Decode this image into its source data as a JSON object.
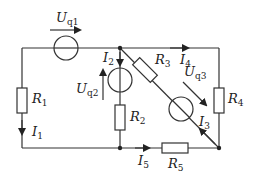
{
  "diagram": {
    "type": "electrical-circuit",
    "sources": [
      {
        "id": "Uq1",
        "label": "U",
        "sub": "q1"
      },
      {
        "id": "Uq2",
        "label": "U",
        "sub": "q2"
      },
      {
        "id": "Uq3",
        "label": "U",
        "sub": "q3"
      }
    ],
    "resistors": [
      {
        "id": "R1",
        "label": "R",
        "sub": "1"
      },
      {
        "id": "R2",
        "label": "R",
        "sub": "2"
      },
      {
        "id": "R3",
        "label": "R",
        "sub": "3"
      },
      {
        "id": "R4",
        "label": "R",
        "sub": "4"
      },
      {
        "id": "R5",
        "label": "R",
        "sub": "5"
      }
    ],
    "currents": [
      {
        "id": "I1",
        "label": "I",
        "sub": "1"
      },
      {
        "id": "I2",
        "label": "I",
        "sub": "2"
      },
      {
        "id": "I3",
        "label": "I",
        "sub": "3"
      },
      {
        "id": "I4",
        "label": "I",
        "sub": "4"
      },
      {
        "id": "I5",
        "label": "I",
        "sub": "5"
      }
    ],
    "colors": {
      "line": "#333333",
      "background": "#ffffff"
    }
  }
}
